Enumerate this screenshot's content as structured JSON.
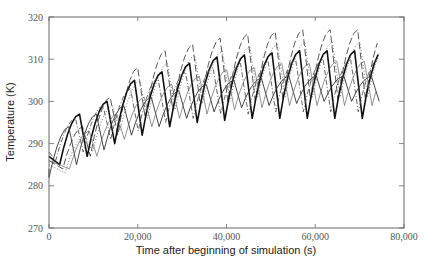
{
  "chart_data": {
    "type": "line",
    "title": "",
    "xlabel": "Time after beginning of simulation (s)",
    "ylabel": "Temperature (K)",
    "xlim": [
      0,
      80000
    ],
    "ylim": [
      270,
      320
    ],
    "xticks": [
      0,
      20000,
      40000,
      60000,
      80000
    ],
    "xtick_labels": [
      "0",
      "20,000",
      "40,000",
      "60,000",
      "80,000"
    ],
    "yticks": [
      270,
      280,
      290,
      300,
      310,
      320
    ],
    "ytick_labels": [
      "270",
      "280",
      "290",
      "300",
      "310",
      "320"
    ],
    "grid": false,
    "legend": null,
    "period_s": 6200,
    "x_end_s": 74500,
    "series": [
      {
        "name": "long-dash (highest)",
        "style": "longdash",
        "color": "#444444",
        "phase_s": 3100,
        "peaks": [
          294,
          301,
          308,
          312,
          313.5,
          315,
          316,
          316.5,
          317,
          317,
          317,
          317
        ],
        "troughs": [
          284,
          287,
          292,
          296,
          298,
          299,
          300,
          300,
          300.5,
          300.5,
          300.5,
          300.5
        ]
      },
      {
        "name": "dotted",
        "style": "dotted",
        "color": "#777777",
        "phase_s": 3600,
        "peaks": [
          292,
          299,
          305,
          309,
          311,
          312,
          313,
          313.5,
          314,
          314,
          314,
          314
        ],
        "troughs": [
          283,
          288,
          293,
          296,
          298,
          299.5,
          300,
          301,
          301,
          301,
          301,
          301
        ]
      },
      {
        "name": "bold solid",
        "style": "solid-bold",
        "color": "#111111",
        "phase_s": 2400,
        "peaks": [
          297,
          300,
          305,
          307,
          309,
          310.5,
          311,
          311.5,
          312,
          312,
          312,
          312
        ],
        "troughs": [
          285,
          287,
          290,
          292,
          294,
          295,
          295.5,
          296,
          296,
          296,
          296,
          296
        ]
      },
      {
        "name": "thin solid",
        "style": "solid",
        "color": "#333333",
        "phase_s": 0,
        "peaks": [
          294,
          297,
          299,
          301,
          302.5,
          304,
          305,
          305.5,
          306,
          306,
          306,
          306
        ],
        "troughs": [
          282,
          285,
          288.5,
          292,
          294,
          296,
          297.5,
          298.5,
          299,
          299.5,
          300,
          300
        ]
      },
      {
        "name": "dash-dot",
        "style": "dashdot",
        "color": "#555555",
        "phase_s": 1500,
        "peaks": [
          296,
          299,
          303,
          305.5,
          307,
          308,
          309,
          309.5,
          310,
          310,
          310,
          310
        ],
        "troughs": [
          286,
          288,
          291,
          293,
          295,
          296,
          297,
          297,
          297.5,
          297.5,
          297.5,
          297.5
        ]
      },
      {
        "name": "thin solid 2",
        "style": "solid-thin",
        "color": "#666666",
        "phase_s": 4600,
        "peaks": [
          293,
          297,
          301,
          304,
          306,
          307.5,
          308,
          309,
          309,
          309.5,
          309.5,
          309.5
        ],
        "troughs": [
          284,
          287,
          291,
          294,
          296,
          297,
          298,
          298.5,
          299,
          299,
          299,
          299
        ]
      }
    ]
  }
}
